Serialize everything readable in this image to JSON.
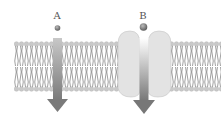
{
  "diagram": {
    "molecules": [
      {
        "id": "A",
        "label": "A",
        "path": "passes directly through lipid bilayer"
      },
      {
        "id": "B",
        "label": "B",
        "path": "passes through channel protein"
      }
    ],
    "colors": {
      "background": "#ffffff",
      "lipid_head": "#c8c8c8",
      "lipid_tail": "#777777",
      "protein": "#e2e2e2",
      "arrow": "#7a7a7a",
      "molecule": "#6e6e6e"
    }
  }
}
